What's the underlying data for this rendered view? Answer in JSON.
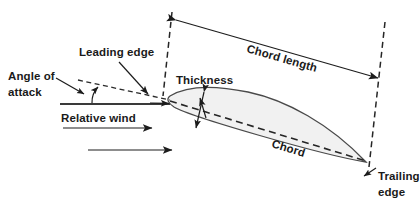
{
  "diagram": {
    "type": "airfoil-cross-section",
    "background_color": "#ffffff",
    "labels": {
      "angle_of_attack_line1": "Angle of",
      "angle_of_attack_line2": "attack",
      "leading_edge": "Leading edge",
      "thickness": "Thickness",
      "chord_length": "Chord length",
      "chord": "Chord",
      "relative_wind": "Relative wind",
      "trailing_edge_line1": "Trailing",
      "trailing_edge_line2": "edge"
    },
    "colors": {
      "airfoil_fill": "#f1f1f1",
      "airfoil_outline": "#4a4a4a",
      "line": "#1c1c1c",
      "text": "#1a1a1a"
    },
    "elements": [
      {
        "name": "airfoil-shape",
        "kind": "filled-outline"
      },
      {
        "name": "chord-line",
        "kind": "dashed-line"
      },
      {
        "name": "chord-length-arrow",
        "kind": "double-headed-arrow"
      },
      {
        "name": "thickness-arrow",
        "kind": "double-headed-arrow"
      },
      {
        "name": "angle-of-attack-arc",
        "kind": "arc-with-arrowhead"
      },
      {
        "name": "relative-wind-arrow-upper",
        "kind": "arrow"
      },
      {
        "name": "relative-wind-arrow-lower",
        "kind": "arrow"
      },
      {
        "name": "horizontal-reference-line",
        "kind": "solid-line"
      },
      {
        "name": "leading-edge-boundary",
        "kind": "dashed-line"
      },
      {
        "name": "trailing-edge-boundary",
        "kind": "dashed-line"
      }
    ]
  }
}
